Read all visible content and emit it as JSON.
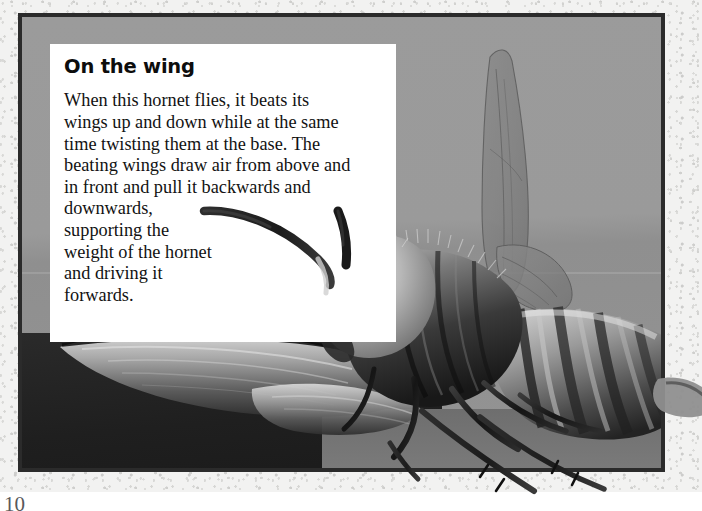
{
  "page": {
    "number": "10",
    "background_color": "#ffffff",
    "paper_color": "#f2f2f1"
  },
  "photo": {
    "border_color": "#2b2b2b",
    "backdrop_color": "#9a9a9a",
    "subject": "hornet-in-flight-photograph",
    "alt": "Close-up black and white photograph of a hornet with its wings raised"
  },
  "caption": {
    "heading": "On the wing",
    "body": "When this hornet flies, it beats its\nwings up and down while at the same\ntime twisting them at the base. The\nbeating wings draw air from above and\nin front and pull it backwards and\ndownwards,\nsupporting the\nweight of the hornet\nand driving it\nforwards.",
    "box_color": "#ffffff",
    "heading_color": "#0d0d0d",
    "body_color": "#121212"
  }
}
